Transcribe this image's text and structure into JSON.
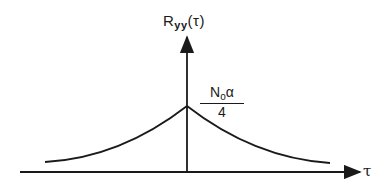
{
  "figure": {
    "y_axis_label": "R",
    "y_axis_label_subscript": "yy",
    "y_axis_label_arg": "(τ)",
    "x_axis_label": "τ",
    "peak_label_numerator": "N",
    "peak_label_numerator_subscript": "o",
    "peak_label_numerator_tail": "α",
    "peak_label_denominator": "4"
  },
  "colors": {
    "ink": "#1a1a1a",
    "background": "#ffffff"
  }
}
